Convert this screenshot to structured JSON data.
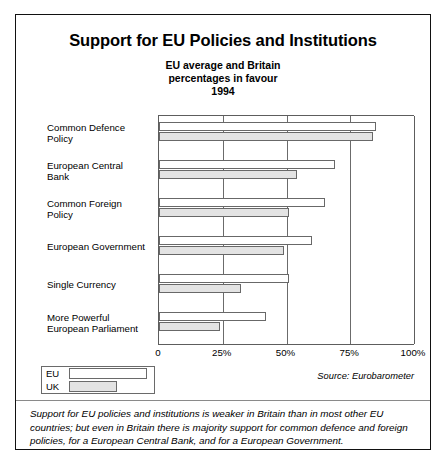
{
  "figure": {
    "title": "Support for EU Policies and Institutions",
    "subtitle_lines": [
      "EU average and Britain",
      "percentages in favour",
      "1994"
    ],
    "source": "Source: Eurobarometer",
    "caption": "Support for EU policies and institutions is weaker in Britain than in most other EU countries; but even in Britain there is majority support for common defence and foreign policies, for a European Central Bank, and for a European Government.",
    "legend": [
      {
        "label": "EU",
        "color": "#ffffff"
      },
      {
        "label": "UK",
        "color": "#e3e3e3"
      }
    ]
  },
  "chart_data": {
    "type": "bar",
    "orientation": "horizontal",
    "title": "Support for EU Policies and Institutions",
    "subtitle": "EU average and Britain percentages in favour 1994",
    "xlabel": "",
    "ylabel": "",
    "xlim": [
      0,
      100
    ],
    "xticks": [
      0,
      25,
      50,
      75,
      100
    ],
    "xticklabels": [
      "0",
      "25%",
      "50%",
      "75%",
      "100%"
    ],
    "grid": true,
    "legend_position": "bottom-left",
    "categories": [
      "Common Defence Policy",
      "European Central Bank",
      "Common Foreign Policy",
      "European Government",
      "Single Currency",
      "More Powerful European Parliament"
    ],
    "category_label_lines": [
      [
        "Common Defence",
        "Policy"
      ],
      [
        "European Central",
        "Bank"
      ],
      [
        "Common Foreign",
        "Policy"
      ],
      [
        "European Government"
      ],
      [
        "Single Currency"
      ],
      [
        "More Powerful",
        "European Parliament"
      ]
    ],
    "series": [
      {
        "name": "EU",
        "color": "#ffffff",
        "values": [
          85,
          69,
          65,
          60,
          51,
          42
        ]
      },
      {
        "name": "UK",
        "color": "#e3e3e3",
        "values": [
          84,
          54,
          51,
          49,
          32,
          24
        ]
      }
    ]
  }
}
